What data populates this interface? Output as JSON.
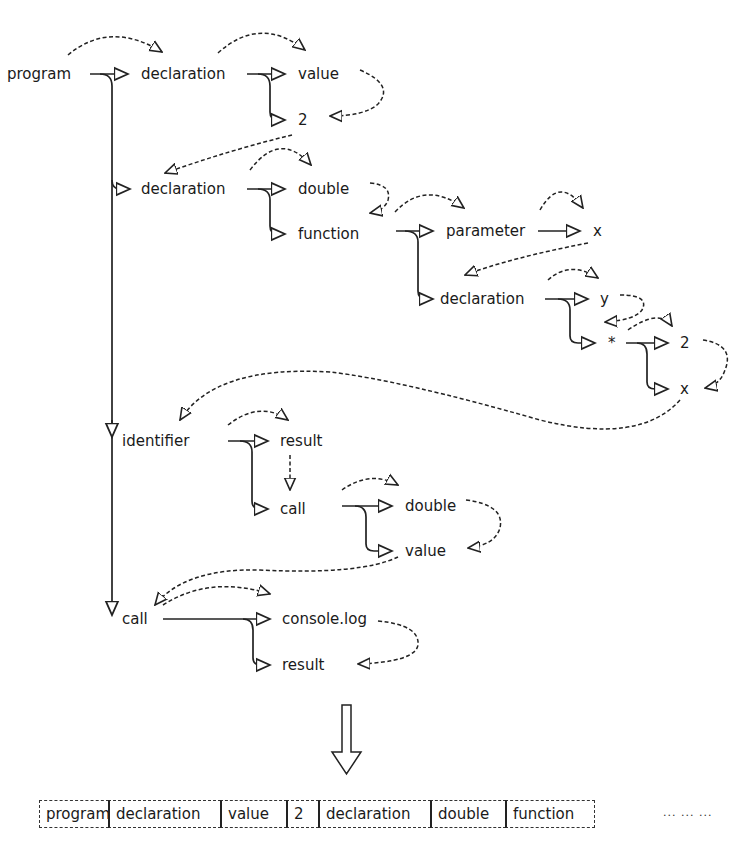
{
  "diagram": {
    "type": "ast-traversal",
    "nodes": [
      {
        "id": "program",
        "label": "program",
        "x": 7,
        "y": 65
      },
      {
        "id": "decl1",
        "label": "declaration",
        "x": 141,
        "y": 65
      },
      {
        "id": "value1",
        "label": "value",
        "x": 298,
        "y": 65
      },
      {
        "id": "num2a",
        "label": "2",
        "x": 298,
        "y": 111
      },
      {
        "id": "decl2",
        "label": "declaration",
        "x": 141,
        "y": 180
      },
      {
        "id": "double1",
        "label": "double",
        "x": 298,
        "y": 180
      },
      {
        "id": "function",
        "label": "function",
        "x": 298,
        "y": 225
      },
      {
        "id": "parameter",
        "label": "parameter",
        "x": 446,
        "y": 222
      },
      {
        "id": "x1",
        "label": "x",
        "x": 593,
        "y": 222
      },
      {
        "id": "decl3",
        "label": "declaration",
        "x": 440,
        "y": 290
      },
      {
        "id": "y",
        "label": "y",
        "x": 600,
        "y": 290
      },
      {
        "id": "mul",
        "label": "*",
        "x": 608,
        "y": 334
      },
      {
        "id": "num2b",
        "label": "2",
        "x": 680,
        "y": 334
      },
      {
        "id": "x2",
        "label": "x",
        "x": 680,
        "y": 380
      },
      {
        "id": "identifier",
        "label": "identifier",
        "x": 122,
        "y": 432
      },
      {
        "id": "result1",
        "label": "result",
        "x": 280,
        "y": 432
      },
      {
        "id": "call1",
        "label": "call",
        "x": 280,
        "y": 500
      },
      {
        "id": "double2",
        "label": "double",
        "x": 405,
        "y": 497
      },
      {
        "id": "value2",
        "label": "value",
        "x": 405,
        "y": 542
      },
      {
        "id": "call2",
        "label": "call",
        "x": 122,
        "y": 610
      },
      {
        "id": "consolelog",
        "label": "console.log",
        "x": 282,
        "y": 610
      },
      {
        "id": "result2",
        "label": "result",
        "x": 282,
        "y": 656
      }
    ],
    "sequence": {
      "cells": [
        "program",
        "declaration",
        "value",
        "2",
        "declaration",
        "double",
        "function"
      ],
      "ellipsis": "... ... ..."
    },
    "colors": {
      "ink": "#1a1a1a",
      "background": "#ffffff"
    }
  }
}
